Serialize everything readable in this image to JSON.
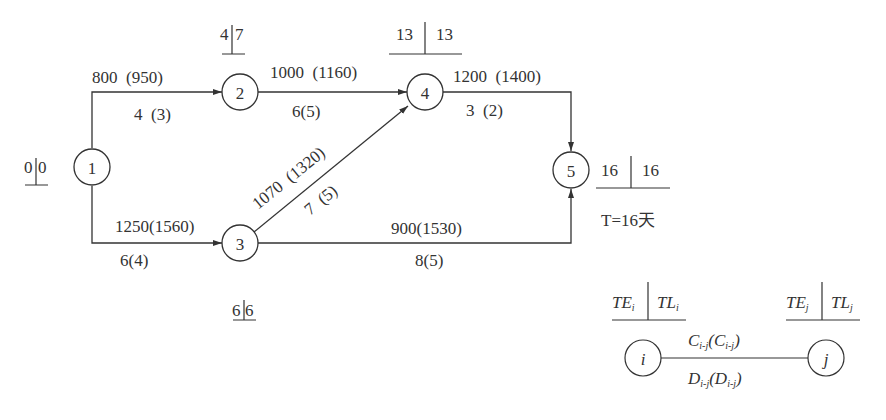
{
  "header_clipped_text": "…………………………………………………………",
  "network": {
    "nodes": [
      {
        "id": "1",
        "label": "1",
        "TE": "0",
        "TL": "0"
      },
      {
        "id": "2",
        "label": "2",
        "TE": "4",
        "TL": "7"
      },
      {
        "id": "3",
        "label": "3",
        "TE": "6",
        "TL": "6"
      },
      {
        "id": "4",
        "label": "4",
        "TE": "13",
        "TL": "13"
      },
      {
        "id": "5",
        "label": "5",
        "TE": "16",
        "TL": "16"
      }
    ],
    "edges": [
      {
        "from": "1",
        "to": "2",
        "cost": "800  (950)",
        "duration": "4  (3)"
      },
      {
        "from": "1",
        "to": "3",
        "cost": "1250(1560)",
        "duration": "6(4)"
      },
      {
        "from": "2",
        "to": "4",
        "cost": "1000  (1160)",
        "duration": "6(5)"
      },
      {
        "from": "3",
        "to": "4",
        "cost": "1070  (1320)",
        "duration": "7  (5)"
      },
      {
        "from": "3",
        "to": "5",
        "cost": "900(1530)",
        "duration": "8(5)"
      },
      {
        "from": "4",
        "to": "5",
        "cost": "1200  (1400)",
        "duration": "3  (2)"
      }
    ],
    "total_time": "T=16天"
  },
  "legend": {
    "node_i": "i",
    "node_j": "j",
    "TE_i": "TE",
    "TL_i": "TL",
    "TE_j": "TE",
    "TL_j": "TL",
    "sub_i": "i",
    "sub_j": "j",
    "cost_label": "C",
    "cost_normal_sub": "i-j",
    "cost_crash_sub": "i-j",
    "duration_label": "D",
    "duration_normal_sub": "i-j",
    "duration_crash_sub": "i-j"
  },
  "colors": {
    "ink": "#333333",
    "background": "#ffffff"
  }
}
